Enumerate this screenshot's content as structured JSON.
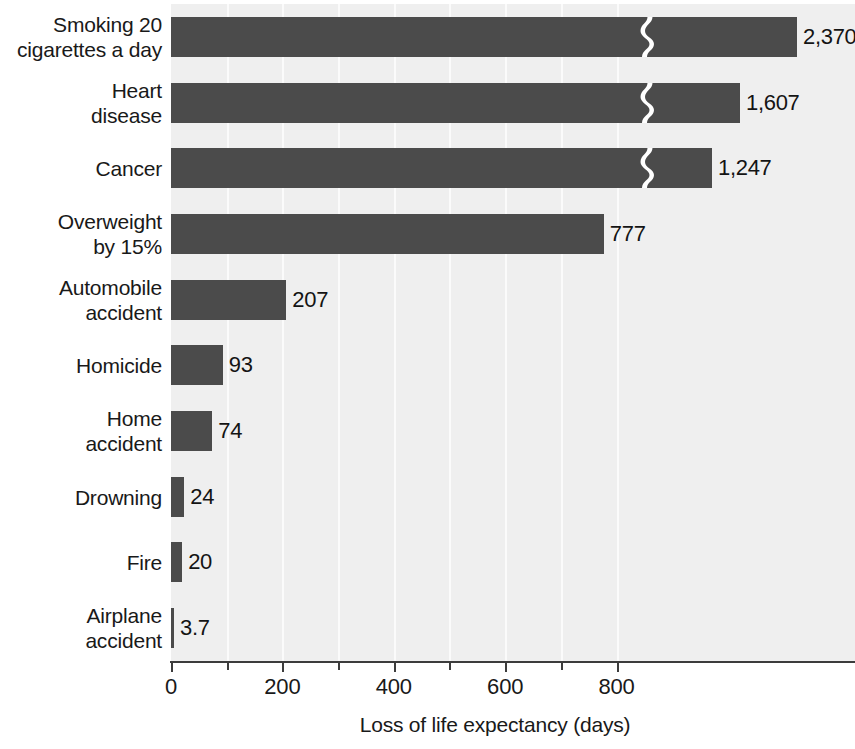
{
  "chart_data": {
    "type": "bar",
    "orientation": "horizontal",
    "title": "",
    "xlabel": "Loss of life expectancy (days)",
    "ylabel": "",
    "categories": [
      "Smoking 20\ncigarettes a day",
      "Heart\ndisease",
      "Cancer",
      "Overweight\nby 15%",
      "Automobile\naccident",
      "Homicide",
      "Home\naccident",
      "Drowning",
      "Fire",
      "Airplane\naccident"
    ],
    "values": [
      2370,
      1607,
      1247,
      777,
      207,
      93,
      74,
      24,
      20,
      3.7
    ],
    "value_labels": [
      "2,370",
      "1,607",
      "1,247",
      "777",
      "207",
      "93",
      "74",
      "24",
      "20",
      "3.7"
    ],
    "broken_axis": true,
    "broken_bars": [
      true,
      true,
      true,
      false,
      false,
      false,
      false,
      false,
      false,
      false
    ],
    "xlim": [
      0,
      900
    ],
    "xticks": [
      0,
      100,
      200,
      300,
      400,
      500,
      600,
      700,
      800
    ],
    "xtick_labels": [
      "0",
      "",
      "200",
      "",
      "400",
      "",
      "600",
      "",
      "800"
    ],
    "labeled_xticks": [
      0,
      200,
      400,
      600,
      800
    ],
    "gridlines": [
      100,
      200,
      300,
      400,
      500,
      600,
      700,
      800
    ],
    "grid": true,
    "legend": "none",
    "colors": {
      "bar": "#4b4b4b",
      "plot_background": "#efefef",
      "gridline": "#fbfbfb",
      "axis": "#3c3c3c",
      "text": "#191919",
      "page_background": "#ffffff"
    },
    "units": "days"
  }
}
